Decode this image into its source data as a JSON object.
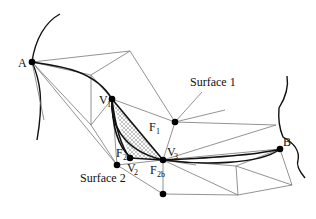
{
  "figure": {
    "type": "mesh geodesic path diagram",
    "labels": {
      "A": "A",
      "B": "B",
      "V1": "V",
      "V1_sub": "1",
      "V2": "V",
      "V2_sub": "2",
      "V3": "V",
      "V3_sub": "3",
      "F1": "F",
      "F1_sub": "1",
      "F2": "F",
      "F2_sub": "2",
      "F2b": "F",
      "F2b_sub": "2b",
      "surface1": "Surface 1",
      "surface2": "Surface 2"
    },
    "colors": {
      "ink": "#111111",
      "mesh": "#777777",
      "hatch": "#888888",
      "background": "#ffffff"
    }
  }
}
